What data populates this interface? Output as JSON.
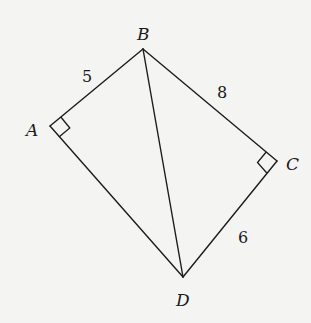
{
  "diagram": {
    "type": "geometry-quadrilateral",
    "vertices": [
      {
        "id": "B",
        "label": "B",
        "x": 143,
        "y": 49,
        "label_x": 137,
        "label_y": 40
      },
      {
        "id": "A",
        "label": "A",
        "x": 50,
        "y": 126,
        "label_x": 26,
        "label_y": 136
      },
      {
        "id": "C",
        "label": "C",
        "x": 277,
        "y": 161,
        "label_x": 286,
        "label_y": 170
      },
      {
        "id": "D",
        "label": "D",
        "x": 183,
        "y": 277,
        "label_x": 176,
        "label_y": 306
      }
    ],
    "edges": [
      {
        "from": "B",
        "to": "A",
        "length_label": "5",
        "label_x": 82,
        "label_y": 82
      },
      {
        "from": "B",
        "to": "C",
        "length_label": "8",
        "label_x": 217,
        "label_y": 98
      },
      {
        "from": "C",
        "to": "D",
        "length_label": "6",
        "label_x": 238,
        "label_y": 243
      },
      {
        "from": "A",
        "to": "D",
        "length_label": ""
      },
      {
        "from": "B",
        "to": "D",
        "length_label": ""
      }
    ],
    "right_angles": [
      {
        "at": "A",
        "between": [
          "B",
          "D"
        ]
      },
      {
        "at": "C",
        "between": [
          "B",
          "D"
        ]
      }
    ],
    "colors": {
      "background": "#f4f4f2",
      "stroke": "#1c1c1c",
      "text": "#1a1a1a"
    }
  }
}
